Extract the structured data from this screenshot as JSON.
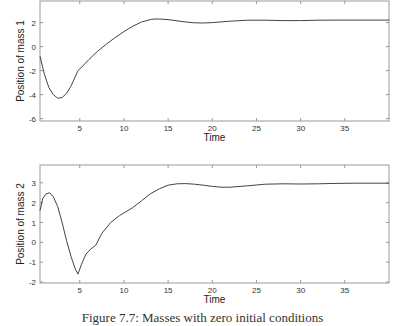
{
  "chart_data": [
    {
      "type": "line",
      "title": "",
      "xlabel": "Time",
      "ylabel": "Position of mass 1",
      "xlim": [
        0.5,
        40
      ],
      "ylim": [
        -6.2,
        3.8
      ],
      "xticks": [
        5,
        10,
        15,
        20,
        25,
        30,
        35
      ],
      "yticks": [
        -6,
        -4,
        -2,
        0,
        2
      ],
      "grid": false,
      "series": [
        {
          "name": "mass 1",
          "x": [
            0.5,
            1,
            1.5,
            2,
            2.5,
            3,
            3.5,
            4,
            4.5,
            4.8,
            5.5,
            6,
            7,
            8,
            9,
            10,
            11,
            12,
            13,
            13.5,
            14,
            15,
            16,
            17,
            18,
            19,
            20,
            22,
            24,
            26,
            28,
            30,
            32,
            34,
            36,
            38,
            40
          ],
          "values": [
            -0.8,
            -2.3,
            -3.4,
            -4.0,
            -4.3,
            -4.25,
            -3.9,
            -3.3,
            -2.5,
            -2.0,
            -1.5,
            -1.1,
            -0.4,
            0.2,
            0.75,
            1.25,
            1.7,
            2.05,
            2.25,
            2.3,
            2.3,
            2.25,
            2.15,
            2.05,
            1.98,
            1.97,
            2.0,
            2.12,
            2.2,
            2.2,
            2.17,
            2.17,
            2.2,
            2.21,
            2.21,
            2.21,
            2.21
          ]
        }
      ]
    },
    {
      "type": "line",
      "title": "",
      "xlabel": "Time",
      "ylabel": "Position of mass 2",
      "xlim": [
        0.5,
        40
      ],
      "ylim": [
        -2.05,
        3.9
      ],
      "xticks": [
        5,
        10,
        15,
        20,
        25,
        30,
        35
      ],
      "yticks": [
        -2,
        -1,
        0,
        1,
        2,
        3
      ],
      "grid": false,
      "series": [
        {
          "name": "mass 2",
          "x": [
            0.5,
            0.8,
            1.2,
            1.6,
            2.0,
            2.5,
            3,
            3.5,
            4,
            4.5,
            4.8,
            5.2,
            5.7,
            6.2,
            6.8,
            7.5,
            8.5,
            9.5,
            11,
            12,
            13,
            14,
            15,
            16,
            17,
            18,
            19,
            20,
            21,
            22,
            24,
            26,
            28,
            30,
            32,
            34,
            36,
            38,
            40
          ],
          "values": [
            1.6,
            2.2,
            2.45,
            2.5,
            2.3,
            1.8,
            1.0,
            0.1,
            -0.7,
            -1.35,
            -1.6,
            -1.1,
            -0.6,
            -0.35,
            -0.15,
            0.45,
            1.0,
            1.35,
            1.75,
            2.1,
            2.45,
            2.7,
            2.88,
            2.95,
            2.96,
            2.93,
            2.88,
            2.82,
            2.78,
            2.78,
            2.85,
            2.93,
            2.95,
            2.94,
            2.95,
            2.97,
            2.98,
            2.98,
            2.98
          ]
        }
      ]
    }
  ],
  "caption": "Figure 7.7: Masses with zero initial conditions"
}
